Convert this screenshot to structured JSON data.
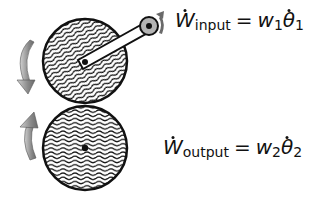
{
  "diagram": {
    "top_gear": {
      "label": "input gear",
      "rotation": "counterclockwise arrow (down on left)"
    },
    "bottom_gear": {
      "label": "output gear",
      "rotation": "clockwise arrow (up on left)"
    },
    "crank": {
      "label": "crank arm attached to top gear"
    }
  },
  "equations": {
    "input": {
      "lhs": "W",
      "lhs_sub": "input",
      "eq": "=",
      "coef": "w",
      "coef_sub": "1",
      "rate": "θ",
      "rate_sub": "1"
    },
    "output": {
      "lhs": "W",
      "lhs_sub": "output",
      "eq": "=",
      "coef": "w",
      "coef_sub": "2",
      "rate": "θ",
      "rate_sub": "2"
    }
  },
  "colors": {
    "stroke": "#111111",
    "arrow_fill": "#9a9a9a",
    "hub_fill": "#b5b5b5"
  }
}
